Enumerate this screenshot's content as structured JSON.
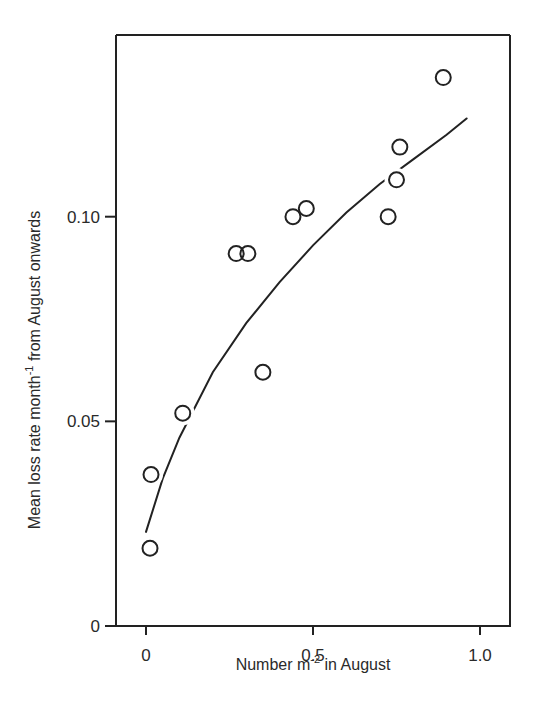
{
  "chart_data": {
    "type": "scatter",
    "title": "",
    "xlabel": "Number m⁻² in August",
    "ylabel": "Mean loss rate month⁻¹ from August onwards",
    "xlabel_parts": {
      "main": "Number m",
      "sup": "-2",
      "rest": " in August"
    },
    "ylabel_parts": {
      "main": "Mean loss rate month",
      "sup": "-1",
      "rest": " from August onwards"
    },
    "xlim": [
      -0.09,
      1.09
    ],
    "ylim": [
      0,
      0.144
    ],
    "x_ticks": [
      {
        "value": 0,
        "label": "0"
      },
      {
        "value": 0.5,
        "label": "0.5"
      },
      {
        "value": 1.0,
        "label": "1.0"
      }
    ],
    "y_ticks": [
      {
        "value": 0,
        "label": "0"
      },
      {
        "value": 0.05,
        "label": "0.05"
      },
      {
        "value": 0.1,
        "label": "0.10"
      }
    ],
    "grid": false,
    "legend": null,
    "series": [
      {
        "name": "observations",
        "marker": "open-circle",
        "x": [
          0.012,
          0.015,
          0.11,
          0.27,
          0.305,
          0.35,
          0.44,
          0.48,
          0.725,
          0.75,
          0.76,
          0.89
        ],
        "y": [
          0.019,
          0.037,
          0.052,
          0.091,
          0.091,
          0.062,
          0.1,
          0.102,
          0.1,
          0.109,
          0.117,
          0.134
        ]
      },
      {
        "name": "fitted curve",
        "marker": "line",
        "x": [
          0.0,
          0.05,
          0.1,
          0.2,
          0.3,
          0.4,
          0.5,
          0.6,
          0.7,
          0.8,
          0.9,
          0.96
        ],
        "y": [
          0.023,
          0.036,
          0.046,
          0.062,
          0.074,
          0.084,
          0.093,
          0.101,
          0.108,
          0.114,
          0.12,
          0.124
        ]
      }
    ]
  }
}
